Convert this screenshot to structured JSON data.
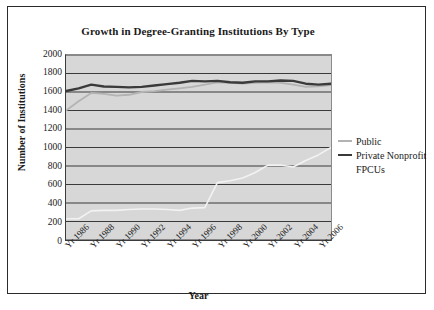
{
  "chart_data": {
    "type": "line",
    "title": "Growth in Degree-Granting Institutions By Type",
    "xlabel": "Year",
    "ylabel": "Number of Institutions",
    "ylim": [
      0,
      2000
    ],
    "ytick_step": 200,
    "yticks": [
      "2000",
      "1800",
      "1600",
      "1400",
      "1200",
      "1000",
      "800",
      "600",
      "400",
      "200",
      "0"
    ],
    "grid": true,
    "legend_position": "right",
    "x": [
      1986,
      1987,
      1988,
      1989,
      1990,
      1991,
      1992,
      1993,
      1994,
      1995,
      1996,
      1997,
      1998,
      1999,
      2000,
      2001,
      2002,
      2003,
      2004,
      2005,
      2006,
      2007
    ],
    "xtick_labels": [
      "Yr 1986",
      "Yr 1988",
      "Yr 1990",
      "Yr 1992",
      "Yr 1994",
      "Yr 1996",
      "Yr 1998",
      "Yr 2000",
      "Yr 2002",
      "Yr 2004",
      "Yr 2006"
    ],
    "series": [
      {
        "name": "Public",
        "color": "#b3b3b3",
        "values": [
          1400,
          1500,
          1590,
          1580,
          1560,
          1570,
          1600,
          1610,
          1625,
          1640,
          1655,
          1680,
          1705,
          1700,
          1690,
          1700,
          1705,
          1700,
          1680,
          1655,
          1660,
          1675
        ]
      },
      {
        "name": "Private Nonprofit",
        "color": "#3a3a3a",
        "values": [
          1610,
          1640,
          1680,
          1660,
          1655,
          1650,
          1655,
          1670,
          1685,
          1700,
          1720,
          1715,
          1720,
          1705,
          1700,
          1715,
          1715,
          1725,
          1720,
          1690,
          1680,
          1690
        ]
      },
      {
        "name": "FPCUs",
        "color": "#f2f2f2",
        "values": [
          230,
          230,
          315,
          320,
          320,
          330,
          335,
          335,
          330,
          320,
          345,
          350,
          620,
          640,
          670,
          730,
          810,
          810,
          790,
          860,
          920,
          1000
        ]
      }
    ]
  },
  "legend": {
    "items": [
      {
        "label": "Public",
        "marker": "public-line-swatch"
      },
      {
        "label": "Private Nonprofit",
        "marker": "nonprofit-line-swatch"
      },
      {
        "label": "FPCUs",
        "marker": "fpcus-line-swatch"
      }
    ]
  },
  "colors": {
    "plot_background": "#d7d7d7",
    "gridline": "#3a3a3a",
    "frame_border": "#2b2b2b",
    "text": "#1a1a1a"
  }
}
